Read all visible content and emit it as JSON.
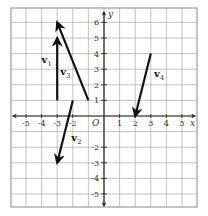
{
  "figure": {
    "type": "coordinate-grid-vectors",
    "x_range": [
      -6,
      6
    ],
    "y_range": [
      -6,
      7
    ],
    "x_axis_label": "x",
    "y_axis_label": "y",
    "origin_label": "O",
    "x_ticks": [
      "-5",
      "-4",
      "-3",
      "-2",
      "1",
      "2",
      "3",
      "4",
      "5"
    ],
    "x_tick_values": [
      -5,
      -4,
      -3,
      -2,
      1,
      2,
      3,
      4,
      5
    ],
    "y_ticks": [
      "6",
      "5",
      "4",
      "3",
      "2",
      "1",
      "-2",
      "-3",
      "-4",
      "-5"
    ],
    "y_tick_values": [
      6,
      5,
      4,
      3,
      2,
      1,
      -2,
      -3,
      -4,
      -5
    ],
    "colors": {
      "grid": "#9a9a9a",
      "axis": "#222222",
      "vector": "#111111",
      "frame": "#888888"
    }
  },
  "vectors": [
    {
      "name": "v",
      "sub": "1",
      "from": [
        -3,
        1
      ],
      "to": [
        -3,
        5
      ],
      "label_pos": [
        -4,
        3.4
      ]
    },
    {
      "name": "v",
      "sub": "2",
      "from": [
        -2,
        1
      ],
      "to": [
        -3,
        -3
      ],
      "label_pos": [
        -2.1,
        -1.6
      ]
    },
    {
      "name": "v",
      "sub": "3",
      "from": [
        -1,
        1
      ],
      "to": [
        -3,
        6
      ],
      "label_pos": [
        -2.8,
        2.6
      ]
    },
    {
      "name": "v",
      "sub": "4",
      "from": [
        3,
        4
      ],
      "to": [
        2,
        0
      ],
      "label_pos": [
        3.2,
        2.5
      ]
    }
  ]
}
